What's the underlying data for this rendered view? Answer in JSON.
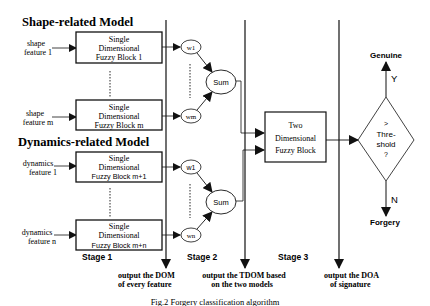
{
  "diagram": {
    "shape_model_title": "Shape-related Model",
    "dynamics_model_title": "Dynamics-related Model",
    "inputs": {
      "shape_feature_1": [
        "shape",
        "feature 1"
      ],
      "shape_feature_m": [
        "shape",
        "feature m"
      ],
      "dynamics_feature_1": [
        "dynamics",
        "feature 1"
      ],
      "dynamics_feature_n": [
        "dynamics",
        "feature n"
      ]
    },
    "blocks": {
      "block_1": [
        "Single",
        "Dimensional",
        "Fuzzy Block 1"
      ],
      "block_m": [
        "Single",
        "Dimensional",
        "Fuzzy Block m"
      ],
      "block_m1": [
        "Single",
        "Dimensional",
        "Fuzzy Block m+1"
      ],
      "block_mn": [
        "Single",
        "Dimensional",
        "Fuzzy Block m+n"
      ],
      "two_dim": [
        "Two",
        "Dimensional",
        "Fuzzy Block"
      ]
    },
    "weights": {
      "w1_shape": "w1",
      "wm": "wm",
      "w1_dyn": "w1",
      "wn": "wn"
    },
    "sum_label": "Sum",
    "decision": [
      "&gt;",
      "Thre-",
      "shold",
      "?"
    ],
    "decision_text": [
      ">",
      "Thre-",
      "shold",
      "?"
    ],
    "yes_label": "Y",
    "no_label": "N",
    "genuine": "Genuine",
    "forgery": "Forgery",
    "stages": {
      "stage1": "Stage 1",
      "stage2": "Stage 2",
      "stage3": "Stage 3"
    },
    "outputs": {
      "dom": [
        "output  the DOM",
        "of every feature"
      ],
      "tdom": [
        "output the TDOM based",
        "on  the two models"
      ],
      "doa": [
        "output the DOA",
        "of signature"
      ]
    },
    "caption": "Fig.2 Forgery classification algorithm"
  }
}
